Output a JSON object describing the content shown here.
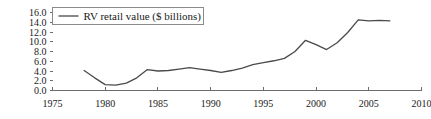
{
  "chart_data": {
    "type": "line",
    "title": "",
    "xlabel": "",
    "ylabel": "",
    "xlim": [
      1975,
      2010
    ],
    "ylim": [
      0.0,
      16.0
    ],
    "grid": false,
    "legend_position": "top-left",
    "xticks": [
      "1975",
      "1980",
      "1985",
      "1990",
      "1995",
      "2000",
      "2005",
      "2010"
    ],
    "xtick_values": [
      1975,
      1980,
      1985,
      1990,
      1995,
      2000,
      2005,
      2010
    ],
    "yticks": [
      "0.0",
      "2.0",
      "4.0",
      "6.0",
      "8.0",
      "10.0",
      "12.0",
      "14.0",
      "16.0"
    ],
    "ytick_values": [
      0.0,
      2.0,
      4.0,
      6.0,
      8.0,
      10.0,
      12.0,
      14.0,
      16.0
    ],
    "series": [
      {
        "name": "RV retail value ($ billions)",
        "color": "#4a4a4a",
        "x": [
          1978,
          1979,
          1980,
          1981,
          1982,
          1983,
          1984,
          1985,
          1986,
          1987,
          1988,
          1989,
          1990,
          1991,
          1992,
          1993,
          1994,
          1995,
          1996,
          1997,
          1998,
          1999,
          2000,
          2001,
          2002,
          2003,
          2004,
          2005,
          2006,
          2007
        ],
        "values": [
          4.1,
          2.6,
          1.2,
          1.1,
          1.5,
          2.6,
          4.3,
          4.0,
          4.1,
          4.4,
          4.7,
          4.4,
          4.1,
          3.7,
          4.1,
          4.6,
          5.3,
          5.7,
          6.1,
          6.6,
          8.0,
          10.3,
          9.4,
          8.4,
          9.8,
          11.9,
          14.5,
          14.3,
          14.4,
          14.3
        ]
      }
    ]
  },
  "legend": {
    "label": "RV retail value ($ billions)"
  },
  "axis_colors": {
    "axis": "#6d6d6d",
    "line": "#4a4a4a",
    "text": "#1a1a1a",
    "background": "#ffffff"
  }
}
